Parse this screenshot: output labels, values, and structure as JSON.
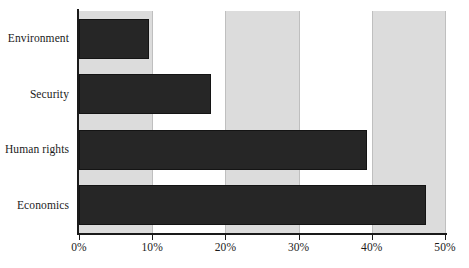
{
  "chart_data": {
    "type": "bar",
    "orientation": "horizontal",
    "title": "",
    "subtitle": "",
    "xlabel": "",
    "ylabel": "",
    "categories": [
      "Environment",
      "Security",
      "Human rights",
      "Economics"
    ],
    "values": [
      9.5,
      18,
      39.3,
      47.4
    ],
    "value_labels": [
      "9.5%",
      "18%",
      "39.3%",
      "47.4%"
    ],
    "xlim": [
      0,
      50
    ],
    "ylim": null,
    "x_tick_labels": [
      "0%",
      "10%",
      "20%",
      "30%",
      "40%",
      "50%"
    ],
    "x_tick_values": [
      0,
      10,
      20,
      30,
      40,
      50
    ],
    "grid": true,
    "grid_axis": "x",
    "legend": false,
    "legend_position": "none",
    "annotations": [],
    "series": [
      {
        "name": "",
        "values": [
          9.5,
          18,
          39.3,
          47.4
        ]
      }
    ],
    "background_bands": [
      {
        "from": 0,
        "to": 10,
        "shaded": true
      },
      {
        "from": 10,
        "to": 20,
        "shaded": false
      },
      {
        "from": 20,
        "to": 30,
        "shaded": true
      },
      {
        "from": 30,
        "to": 40,
        "shaded": false
      },
      {
        "from": 40,
        "to": 50,
        "shaded": true
      }
    ],
    "colors": {
      "bar": "#262626",
      "bar_border": "#141414",
      "band_shaded": "#dcdcdc",
      "band_plain": "#ffffff",
      "gridline": "#bfbfbf",
      "axis": "#1a1a1a",
      "text": "#1b1b1b",
      "background": "#ffffff"
    }
  }
}
